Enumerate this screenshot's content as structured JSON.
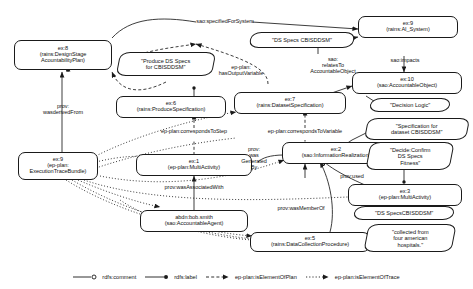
{
  "diagram": {
    "nodes": [
      {
        "id": "ex8",
        "l1": "ex:8",
        "l2": "(rains:DesignStage",
        "l3": "AcountabilityPlan)"
      },
      {
        "id": "ex6",
        "l1": "ex:6",
        "l2": "(rains:ProduceSpecification)"
      },
      {
        "id": "ex7",
        "l1": "ex:7",
        "l2": "(rains:DatasetSpecification)"
      },
      {
        "id": "ex9sys",
        "l1": "ex:9",
        "l2": "(rains:AI_System)"
      },
      {
        "id": "ex10",
        "l1": "ex:10",
        "l2": "(sao:AccountableObject)"
      },
      {
        "id": "ex9etb",
        "l1": "ex:9",
        "l2": "(ep-plan:",
        "l3": "ExecutionTraceBundle)"
      },
      {
        "id": "ex1",
        "l1": "ex:1",
        "l2": "(ep-plan:MultiActivity)"
      },
      {
        "id": "ex2",
        "l1": "ex:2",
        "l2": "(sao:InformationRealization)"
      },
      {
        "id": "ex3",
        "l1": "ex:3",
        "l2": "(ep-plan:MultiActivity)"
      },
      {
        "id": "bob",
        "l1": "abdn:bob.smith",
        "l2": "(sao:AccountableAgent)"
      },
      {
        "id": "ex5",
        "l1": "ex:5",
        "l2": "(rains:DataCollectionProcedure)"
      }
    ],
    "literals": [
      {
        "id": "lit_produce",
        "text": "\"Produce DS Specs\nfor CBISDDSM\""
      },
      {
        "id": "lit_dsspecs",
        "text": "\"DS Specs CBISDDSM\""
      },
      {
        "id": "lit_decision",
        "text": "\"Decision Logic\""
      },
      {
        "id": "lit_specfor",
        "text": "\"Specification for\ndataset CBISDDSM\""
      },
      {
        "id": "lit_decide",
        "text": "\"Decide:Confirm\nDS Specs\nFitness\""
      },
      {
        "id": "lit_dsspecs2",
        "text": "\"DS SpecsCBISDDSM\""
      },
      {
        "id": "lit_collected",
        "text": "\"collected from\nfour american\nhospitals.\""
      }
    ],
    "edge_labels": [
      {
        "id": "el_specifiedfor",
        "text": "sao:specifiedForSystem"
      },
      {
        "id": "el_saoimpacts",
        "text": "sao:impacts"
      },
      {
        "id": "el_hasoutputvar",
        "text": "ep-plan:\nhasOutputVariable"
      },
      {
        "id": "el_relatesto",
        "text": "sao:\nrelatesTo\nAccountableObject"
      },
      {
        "id": "el_wasderivedfrom",
        "text": "prov:\nwasderivedFrom"
      },
      {
        "id": "el_correspondsstep",
        "text": "ep-plan:correspondsToStep"
      },
      {
        "id": "el_correspondsvar",
        "text": "ep-plan:correspondsToVariable"
      },
      {
        "id": "el_wasassociated",
        "text": "prov:wasAssociatedWith"
      },
      {
        "id": "el_wasgenerated",
        "text": "prov:\nwas\nGenerated\nBy"
      },
      {
        "id": "el_provused",
        "text": "prov:used"
      },
      {
        "id": "el_wasmemberof",
        "text": "prov:wasMemberOf"
      }
    ],
    "legend": [
      {
        "id": "lg_comment",
        "label": "rdfs:comment",
        "marker": "hollow-dot-arrow-icon",
        "stroke": "solid"
      },
      {
        "id": "lg_label",
        "label": "rdfs:label",
        "marker": "filled-dot-arrow-icon",
        "stroke": "solid"
      },
      {
        "id": "lg_plan",
        "label": "ep-plan:isElementOfPlan",
        "marker": "filled-arrow-icon",
        "stroke": "dashed"
      },
      {
        "id": "lg_trace",
        "label": "ep-plan:isElementOfTrace",
        "marker": "filled-arrow-icon",
        "stroke": "dotted"
      }
    ],
    "colors": {
      "ink": "#1a1a1a",
      "background": "#ffffff"
    }
  }
}
